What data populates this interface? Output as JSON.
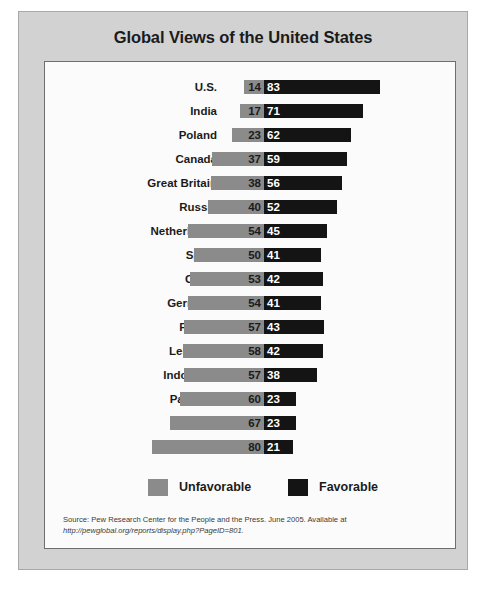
{
  "chart_data": {
    "type": "bar",
    "title": "Global Views of the United States",
    "xlabel": "",
    "ylabel": "",
    "orientation": "horizontal",
    "stacked": "diverging-centered",
    "grid": false,
    "legend_position": "bottom-center",
    "categories": [
      "U.S.",
      "India",
      "Poland",
      "Canada",
      "Great Britain",
      "Russia",
      "Netherlands",
      "Spain",
      "China",
      "Germany",
      "France",
      "Lebanon",
      "Indonesia",
      "Pakistan",
      "Turkey",
      "Jordan"
    ],
    "series": [
      {
        "name": "Unfavorable",
        "color": "#8b8b8b",
        "values": [
          14,
          17,
          23,
          37,
          38,
          40,
          54,
          50,
          53,
          54,
          57,
          58,
          57,
          60,
          67,
          80
        ]
      },
      {
        "name": "Favorable",
        "color": "#141414",
        "values": [
          83,
          71,
          62,
          59,
          56,
          52,
          45,
          41,
          42,
          41,
          43,
          42,
          38,
          23,
          23,
          21
        ]
      }
    ],
    "value_unit": "percent",
    "max_value": 100
  },
  "figure": {
    "title": "Global Views of the United States",
    "legend": [
      {
        "label": "Unfavorable",
        "swatch": "gray"
      },
      {
        "label": "Favorable",
        "swatch": "black"
      }
    ],
    "source": {
      "text": "Source: Pew Research Center for the People and the Press. June 2005. Available at",
      "url": "http://pewglobal.org/reports/display.php?PageID=801."
    }
  },
  "colors": {
    "unfavorable": "#8b8b8b",
    "favorable": "#141414",
    "panel_background": "#d2d2d2",
    "plot_background": "#fbfbfb"
  }
}
